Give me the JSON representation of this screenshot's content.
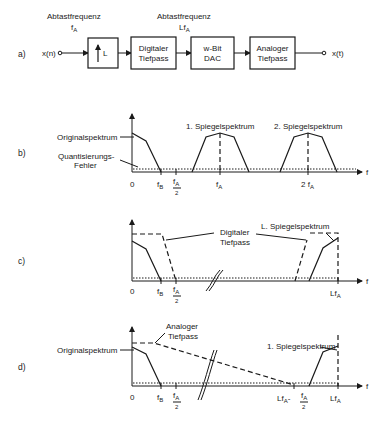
{
  "panel_a": {
    "label": "a)",
    "rate1_title": "Abtastfrequenz",
    "rate1_symbol": "f",
    "rate1_sub": "A",
    "rate2_title": "Abtastfrequenz",
    "rate2_symbol": "Lf",
    "rate2_sub": "A",
    "input": "x(n)",
    "output": "x(t)",
    "blocks": {
      "upsampler": "L",
      "digital_lp_1": "Digitaler",
      "digital_lp_2": "Tiefpass",
      "dac_1": "w-Bit",
      "dac_2": "DAC",
      "analog_lp_1": "Analoger",
      "analog_lp_2": "Tiefpass"
    }
  },
  "panel_b": {
    "label": "b)",
    "original": "Originalspektrum",
    "quant_1": "Quantisierungs-",
    "quant_2": "Fehler",
    "mirror1": "1. Spiegelspektrum",
    "mirror2": "2. Spiegelspektrum",
    "axis_f": "f",
    "ticks": {
      "zero": "0",
      "fB": "f",
      "fB_sub": "B",
      "fA2_num": "f",
      "fA2_num_sub": "A",
      "fA2_den": "2",
      "fA": "f",
      "fA_sub": "A",
      "two_fA": "2 f",
      "two_fA_sub": "A"
    }
  },
  "panel_c": {
    "label": "c)",
    "digital_lp_1": "Digitaler",
    "digital_lp_2": "Tiefpass",
    "mirrorL": "L. Spiegelspektrum",
    "axis_f": "f",
    "ticks": {
      "zero": "0",
      "fB": "f",
      "fB_sub": "B",
      "fA2_num": "f",
      "fA2_num_sub": "A",
      "fA2_den": "2",
      "LfA": "Lf",
      "LfA_sub": "A"
    }
  },
  "panel_d": {
    "label": "d)",
    "analog_lp_1": "Analoger",
    "analog_lp_2": "Tiefpass",
    "original": "Originalspektrum",
    "mirror1": "1. Spiegelspektrum",
    "axis_f": "f",
    "ticks": {
      "zero": "0",
      "fB": "f",
      "fB_sub": "B",
      "fA2_num": "f",
      "fA2_num_sub": "A",
      "fA2_den": "2",
      "LfA_minus": "Lf",
      "LfA_minus_sub": "A",
      "minus": "-",
      "half_num": "f",
      "half_num_sub": "A",
      "half_den": "2",
      "LfA": "Lf",
      "LfA_sub": "A"
    }
  }
}
